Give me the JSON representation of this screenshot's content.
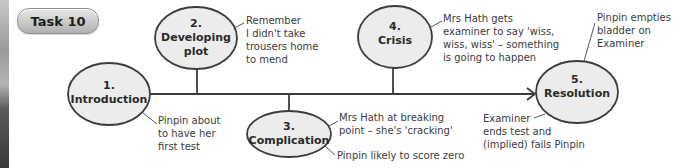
{
  "task_badge": {
    "label": "Task 10"
  },
  "colors": {
    "ellipse_fill": "#ececec",
    "stroke": "#3c3c3c",
    "text": "#2a2a2a",
    "badge_fill": "#c9c9c9"
  },
  "nodes": [
    {
      "number": "1.",
      "title": "Introduction"
    },
    {
      "number": "2.",
      "title": "Developing\nplot"
    },
    {
      "number": "3.",
      "title": "Complication"
    },
    {
      "number": "4.",
      "title": "Crisis"
    },
    {
      "number": "5.",
      "title": "Resolution"
    }
  ],
  "notes": {
    "introduction": "Pinpin about\nto have her\nfirst test",
    "developing_plot": "Remember\nI didn't take\ntrousers home\nto mend",
    "complication_1": "Mrs Hath at breaking\npoint – she's 'cracking'",
    "complication_2": "Pinpin likely to score zero",
    "crisis": "Mrs Hath gets\nexaminer to say 'wiss,\nwiss, wiss' – something\nis going to happen",
    "resolution_top": "Pinpin empties\nbladder on\nExaminer",
    "resolution_bottom": "Examiner\nends test and\n(implied) fails Pinpin"
  }
}
